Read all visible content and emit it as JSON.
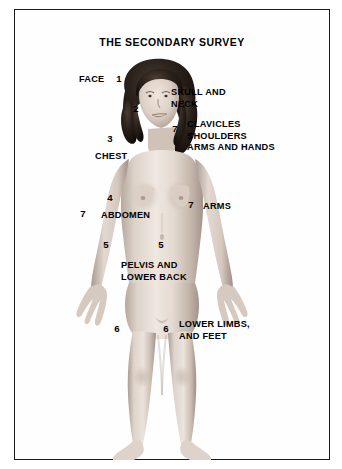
{
  "title": "THE SECONDARY SURVEY",
  "colors": {
    "border": "#1a1a1a",
    "background": "#ffffff",
    "text": "#000000",
    "skin_light": "#e8ded6",
    "skin_mid": "#cdbfb4",
    "skin_shadow": "#a89a8f",
    "hair": "#241d19"
  },
  "figure": {
    "name": "standing-female-anatomical-figure"
  },
  "region_labels": [
    {
      "key": "face",
      "text": "FACE",
      "x": 78,
      "y": 65
    },
    {
      "key": "skull_neck",
      "text": "SKULL AND\nNECK",
      "x": 170,
      "y": 78
    },
    {
      "key": "clavicles",
      "text": "CLAVICLES\nSHOULDERS\nARMS AND HANDS",
      "x": 186,
      "y": 110
    },
    {
      "key": "chest",
      "text": "CHEST",
      "x": 94,
      "y": 142
    },
    {
      "key": "abdomen",
      "text": "ABDOMEN",
      "x": 100,
      "y": 201
    },
    {
      "key": "arms",
      "text": "ARMS",
      "x": 202,
      "y": 192
    },
    {
      "key": "pelvis",
      "text": "PELVIS AND\nLOWER BACK",
      "x": 120,
      "y": 251
    },
    {
      "key": "lower_limbs",
      "text": "LOWER LIMBS,\nAND FEET",
      "x": 178,
      "y": 310
    }
  ],
  "number_markers": [
    {
      "key": "marker-1-face",
      "value": "1",
      "x": 112,
      "y": 66
    },
    {
      "key": "marker-2-neck",
      "value": "2",
      "x": 129,
      "y": 96
    },
    {
      "key": "marker-7-shoulder-right",
      "value": "7",
      "x": 168,
      "y": 116
    },
    {
      "key": "marker-3-chest",
      "value": "3",
      "x": 103,
      "y": 126
    },
    {
      "key": "marker-4-abdomen",
      "value": "4",
      "x": 103,
      "y": 185
    },
    {
      "key": "marker-7-arm-left",
      "value": "7",
      "x": 76,
      "y": 201
    },
    {
      "key": "marker-7-arm-right",
      "value": "7",
      "x": 184,
      "y": 192
    },
    {
      "key": "marker-5-pelvis-left",
      "value": "5",
      "x": 99,
      "y": 232
    },
    {
      "key": "marker-5-pelvis-right",
      "value": "5",
      "x": 154,
      "y": 232
    },
    {
      "key": "marker-6-limb-left",
      "value": "6",
      "x": 110,
      "y": 316
    },
    {
      "key": "marker-6-limb-right",
      "value": "6",
      "x": 159,
      "y": 316
    }
  ]
}
